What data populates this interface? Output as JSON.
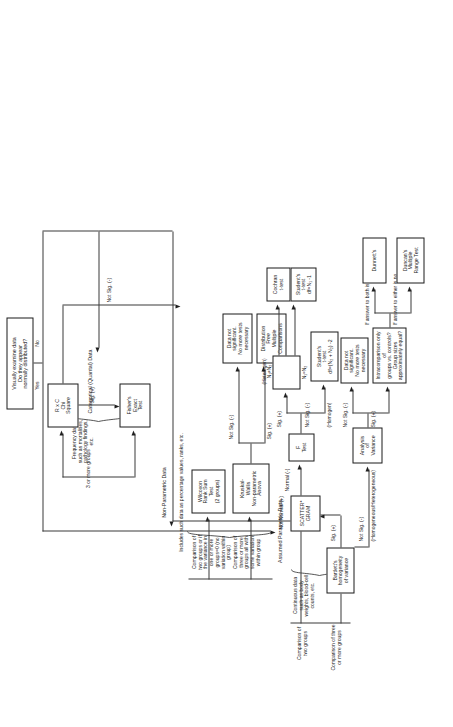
{
  "diagram": {
    "orientation": "rotated-90-ccw",
    "ink_color": "#1a1a1a",
    "background_color": "#ffffff"
  },
  "nodes": {
    "start": "Visually examine data\nDo they appear\nnormally distributed?",
    "rxc_chi_square": "R x C\nChi\nSquare",
    "fishers_exact": "Fisher's\nExact\nTest",
    "kruskal_wallis": "Kruskal-\nWallis\nNon-parametric\nAnova",
    "wilcoxon": "Wilcoxon\nRank Sum\nTest\n(2 groups)",
    "data_not_sig_np": "Data not\nsignificant.\nNo more tests\nnecessary",
    "distribution_free": "Distribution\nFree\nMultiple\nComparisons",
    "scattergram": "SCATTER*\nGRAM",
    "bartletts": "Bartlett's\nhomogeneity\nof variance",
    "f_test": "F\nTest",
    "cochran_t": "Cochran\nt-test",
    "students_t_n1": "Student's\nt-test\ndf=N₁ -1",
    "students_t_pooled": "Student's\nt-test\ndf=(N₂ + N₂) -2",
    "anova": "Analysis\nof\nVariance",
    "data_not_sig_anova": "Data not\nsignificant.\nNo more tests\nnecessary",
    "intracomparison": "Intracomparison only of\ngroups vs. controls?\nGroup sizes\napproximately equal?",
    "dunnetts": "Dunnett's",
    "duncans": "Duncan's Multiple\nRange Test"
  },
  "branch_labels": {
    "yes": "Yes",
    "no": "No",
    "sig_plus_chi": "Sig. (+)",
    "not_sig_chi": "Not Sig. (-)",
    "sig_plus_kw": "Sig. (+)",
    "not_sig_kw": "Not Sig. (-)",
    "not_normal": "Not Normal (+)",
    "normal": "Normal (-)",
    "sig_plus_bartlett": "Sig. (+)",
    "not_sig_bartlett": "Not Sig. (-)",
    "heterogeneous": "(Homogeneous/Heterogeneous)",
    "sig_plus_f": "Sig. (+)",
    "not_sig_f": "Not Sig. (-)",
    "f_hetero": "(Heterogen)\nN₁≠N₂",
    "f_n1_eq_n2": "N₁=N₂",
    "f_homogen": "(Homogen)",
    "anova_not_sig": "Not Sig. (-)",
    "anova_sig": "Sig. (+)",
    "answer_yes": "If answer to both is yes",
    "answer_no": "If answer to either is no"
  },
  "group_headings": {
    "categorical_title": "Categorical (Quantal) Data",
    "categorical_desc": "Frequency data such as mortalities,\npathology findings, etc.",
    "categorical_3plus": "3 or more groups",
    "nonparametric_title": "Non-Parametric Data",
    "nonparametric_desc": "Includes such data as percentage values, ranks, etc.",
    "np_two_groups": "Comparison of\ntwo groups or if\nthe variance in\none or more\ngroups=0 (no\nvariation within\ngroup)",
    "np_three_groups": "Comparison of\nthree or more\ngroups all with\nsome variation\nwithin group",
    "parametric_title": "Assumed Parametric Data",
    "parametric_desc": "Continuous data\nsuch as body\nweights, blood-cell\ncounts, etc.",
    "p_two_groups": "Comparison of\ntwo groups",
    "p_three_groups": "Comparison of three\nor more groups"
  }
}
